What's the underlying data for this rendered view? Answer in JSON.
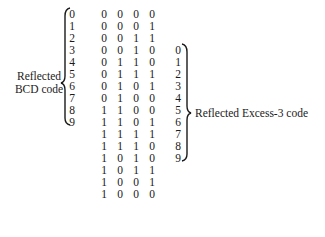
{
  "left_label": {
    "line1": "Reflected",
    "line2": "BCD code"
  },
  "right_label": "Reflected Excess-3 code",
  "bcd_digits": [
    "0",
    "1",
    "2",
    "3",
    "4",
    "5",
    "6",
    "7",
    "8",
    "9"
  ],
  "excess3_digits": [
    "0",
    "1",
    "2",
    "3",
    "4",
    "5",
    "6",
    "7",
    "8",
    "9"
  ],
  "excess3_start_row": 3,
  "code_rows": [
    [
      "0",
      "0",
      "0",
      "0"
    ],
    [
      "0",
      "0",
      "0",
      "1"
    ],
    [
      "0",
      "0",
      "1",
      "1"
    ],
    [
      "0",
      "0",
      "1",
      "0"
    ],
    [
      "0",
      "1",
      "1",
      "0"
    ],
    [
      "0",
      "1",
      "1",
      "1"
    ],
    [
      "0",
      "1",
      "0",
      "1"
    ],
    [
      "0",
      "1",
      "0",
      "0"
    ],
    [
      "1",
      "1",
      "0",
      "0"
    ],
    [
      "1",
      "1",
      "0",
      "1"
    ],
    [
      "1",
      "1",
      "1",
      "1"
    ],
    [
      "1",
      "1",
      "1",
      "0"
    ],
    [
      "1",
      "0",
      "1",
      "0"
    ],
    [
      "1",
      "0",
      "1",
      "1"
    ],
    [
      "1",
      "0",
      "0",
      "1"
    ],
    [
      "1",
      "0",
      "0",
      "0"
    ]
  ]
}
